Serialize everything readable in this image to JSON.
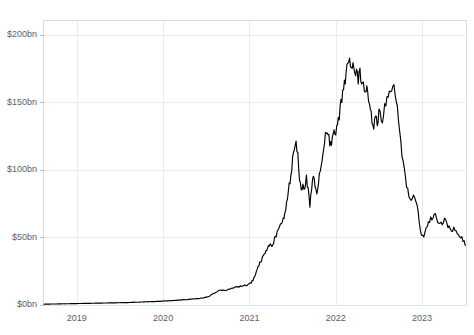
{
  "chart_data": {
    "type": "line",
    "title": "",
    "subtitle": "",
    "xlabel": "",
    "ylabel": "",
    "xlim": [
      2018.62,
      2023.52
    ],
    "ylim": [
      0,
      210
    ],
    "grid": true,
    "legend": false,
    "legend_position": "none",
    "y_ticks": [
      0,
      50,
      100,
      150,
      200
    ],
    "y_tick_labels": [
      "$0bn",
      "$50bn",
      "$100bn",
      "$150bn",
      "$200bn"
    ],
    "x_ticks": [
      2019,
      2020,
      2021,
      2022,
      2023
    ],
    "x_tick_labels": [
      "2019",
      "2020",
      "2021",
      "2022",
      "2023"
    ],
    "units": "billions of US dollars",
    "series": [
      {
        "name": "Market value",
        "color": "#000000",
        "x": [
          2018.62,
          2018.7,
          2018.78,
          2018.86,
          2018.94,
          2019.02,
          2019.1,
          2019.18,
          2019.26,
          2019.34,
          2019.42,
          2019.5,
          2019.58,
          2019.66,
          2019.74,
          2019.82,
          2019.9,
          2019.98,
          2020.06,
          2020.14,
          2020.22,
          2020.3,
          2020.38,
          2020.46,
          2020.52,
          2020.56,
          2020.6,
          2020.64,
          2020.68,
          2020.72,
          2020.76,
          2020.8,
          2020.84,
          2020.88,
          2020.92,
          2020.96,
          2021.0,
          2021.02,
          2021.04,
          2021.06,
          2021.08,
          2021.1,
          2021.12,
          2021.14,
          2021.16,
          2021.18,
          2021.2,
          2021.22,
          2021.24,
          2021.26,
          2021.28,
          2021.3,
          2021.32,
          2021.34,
          2021.36,
          2021.38,
          2021.4,
          2021.42,
          2021.44,
          2021.46,
          2021.48,
          2021.5,
          2021.52,
          2021.54,
          2021.56,
          2021.58,
          2021.6,
          2021.62,
          2021.64,
          2021.66,
          2021.68,
          2021.7,
          2021.72,
          2021.74,
          2021.76,
          2021.78,
          2021.8,
          2021.82,
          2021.84,
          2021.86,
          2021.88,
          2021.9,
          2021.92,
          2021.94,
          2021.96,
          2021.98,
          2022.0,
          2022.02,
          2022.04,
          2022.06,
          2022.08,
          2022.1,
          2022.12,
          2022.14,
          2022.16,
          2022.18,
          2022.2,
          2022.22,
          2022.24,
          2022.26,
          2022.28,
          2022.3,
          2022.32,
          2022.34,
          2022.36,
          2022.38,
          2022.4,
          2022.42,
          2022.44,
          2022.46,
          2022.48,
          2022.5,
          2022.54,
          2022.58,
          2022.62,
          2022.66,
          2022.7,
          2022.74,
          2022.78,
          2022.82,
          2022.86,
          2022.9,
          2022.94,
          2022.98,
          2023.02,
          2023.06,
          2023.1,
          2023.14,
          2023.18,
          2023.22,
          2023.26,
          2023.3,
          2023.34,
          2023.38,
          2023.42,
          2023.46,
          2023.5
        ],
        "values": [
          0.6,
          0.7,
          0.8,
          0.9,
          1.0,
          1.1,
          1.2,
          1.3,
          1.4,
          1.5,
          1.6,
          1.7,
          1.8,
          2.0,
          2.2,
          2.4,
          2.6,
          2.8,
          3.1,
          3.4,
          3.8,
          4.2,
          4.6,
          5.2,
          6.0,
          7.6,
          9.0,
          10.5,
          11.2,
          10.6,
          11.4,
          12.4,
          13.0,
          13.6,
          14.2,
          14.8,
          15.4,
          16.5,
          18.5,
          21.0,
          24.5,
          28.0,
          31.5,
          33.5,
          36.0,
          38.5,
          41.0,
          43.5,
          46.0,
          44.0,
          47.0,
          50.0,
          53.0,
          56.0,
          59.0,
          62.0,
          66.0,
          72.0,
          80.0,
          88.0,
          97.0,
          108.0,
          117.0,
          123.0,
          110.0,
          95.0,
          86.0,
          88.0,
          84.0,
          93.0,
          84.0,
          74.0,
          86.0,
          93.0,
          88.0,
          84.0,
          90.0,
          99.0,
          108.0,
          116.0,
          124.0,
          130.0,
          124.0,
          118.0,
          124.0,
          131.0,
          126.0,
          133.0,
          141.0,
          148.0,
          155.0,
          163.0,
          171.0,
          177.0,
          180.0,
          172.0,
          178.0,
          168.0,
          176.0,
          166.0,
          173.0,
          160.0,
          167.0,
          158.0,
          164.0,
          152.0,
          144.0,
          137.0,
          131.0,
          140.0,
          132.0,
          145.0,
          137.0,
          150.0,
          158.0,
          164.0,
          152.0,
          128.0,
          106.0,
          88.0,
          80.0,
          79.0,
          76.0,
          54.0,
          52.0,
          58.0,
          63.0,
          67.0,
          62.0,
          60.0,
          63.0,
          58.0,
          55.0,
          57.0,
          53.0,
          50.0,
          44.0
        ]
      }
    ],
    "annotations": []
  },
  "axis": {
    "y_label_format": "$Nbn",
    "x_label_format": "YYYY"
  }
}
